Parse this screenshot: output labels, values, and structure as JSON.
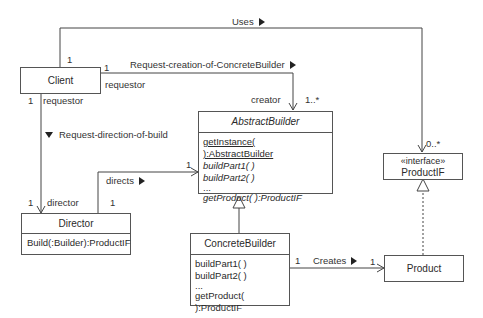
{
  "diagram": {
    "type": "UML class diagram",
    "classes": {
      "client": {
        "name": "Client"
      },
      "director": {
        "name": "Director",
        "operations": [
          "Build(:Builder):ProductIF"
        ]
      },
      "abstract_builder": {
        "name": "AbstractBuilder",
        "operations": [
          "getInstance( ):AbstractBuilder",
          "buildPart1( )",
          "buildPart2( )",
          "...",
          "getProduct( ):ProductIF"
        ]
      },
      "concrete_builder": {
        "name": "ConcreteBuilder",
        "operations": [
          "buildPart1( )",
          "buildPart2( )",
          "...",
          "getProduct( ):ProductIF"
        ]
      },
      "product_if": {
        "stereotype": "«interface»",
        "name": "ProductIF"
      },
      "product": {
        "name": "Product"
      }
    },
    "associations": {
      "uses": {
        "label": "Uses",
        "client_mult": "1",
        "target_mult": "0..*"
      },
      "request_creation": {
        "label": "Request-creation-of-ConcreteBuilder",
        "client_mult": "1",
        "client_role": "requestor",
        "target_role": "creator",
        "target_mult": "1..*"
      },
      "request_direction": {
        "label": "Request-direction-of-build",
        "client_mult": "1",
        "client_role": "requestor",
        "target_role": "director",
        "target_mult": "1"
      },
      "directs": {
        "label": "directs",
        "source_mult": "1",
        "target_mult": "1"
      },
      "creates": {
        "label": "Creates",
        "source_mult": "1",
        "target_mult": "1"
      }
    }
  }
}
